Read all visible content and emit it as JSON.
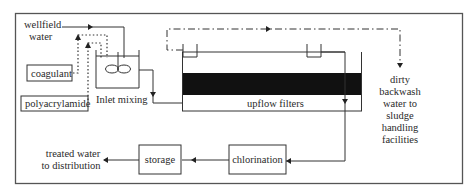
{
  "diagram": {
    "type": "water-treatment-process-flow",
    "nodes": {
      "wellfield": {
        "line1": "wellfield",
        "line2": "water"
      },
      "coagulant": {
        "label": "coagulant"
      },
      "polyacrylamide": {
        "label": "polyacrylamide"
      },
      "inlet_mixing": {
        "label": "Inlet mixing"
      },
      "upflow_filters": {
        "label": "upflow filters"
      },
      "backwash": {
        "lines": [
          "dirty",
          "backwash",
          "water to",
          "sludge",
          "handling",
          "facilities"
        ]
      },
      "chlorination": {
        "label": "chlorination"
      },
      "storage": {
        "label": "storage"
      },
      "distribution": {
        "line1": "treated water",
        "line2": "to distribution"
      }
    },
    "edges": [
      {
        "from": "wellfield water",
        "to": "Inlet mixing",
        "style": "solid"
      },
      {
        "from": "coagulant",
        "to": "Inlet mixing",
        "style": "dotted"
      },
      {
        "from": "polyacrylamide",
        "to": "Inlet mixing",
        "style": "dotted"
      },
      {
        "from": "Inlet mixing",
        "to": "upflow filters",
        "style": "solid"
      },
      {
        "from": "upflow filters",
        "to": "dirty backwash water to sludge handling facilities",
        "style": "dash-dot"
      },
      {
        "from": "upflow filters",
        "to": "chlorination",
        "style": "solid"
      },
      {
        "from": "chlorination",
        "to": "storage",
        "style": "solid"
      },
      {
        "from": "storage",
        "to": "treated water to distribution",
        "style": "solid"
      }
    ],
    "colors": {
      "line": "#333333",
      "filter_media": "#111111",
      "background": "#ffffff"
    }
  }
}
